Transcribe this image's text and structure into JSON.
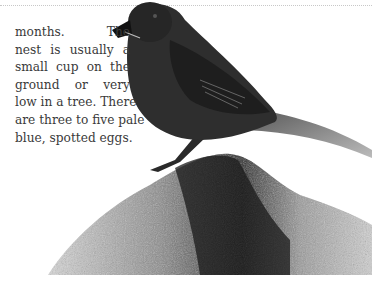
{
  "page": {
    "body_text_lines": [
      "months.     The",
      "nest is usually a",
      "small cup on the",
      "ground  or  very",
      "low in a tree. There",
      "are three to five pale",
      "blue, spotted eggs."
    ],
    "photo": {
      "subject": "bird perched on a rock",
      "style": "grayscale"
    }
  }
}
